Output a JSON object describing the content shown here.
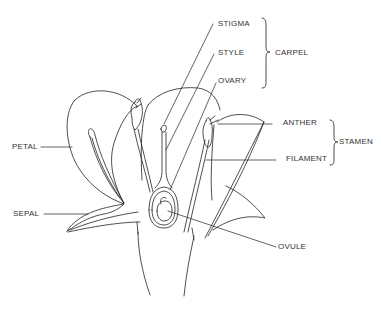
{
  "diagram": {
    "type": "labeled-illustration",
    "line_color": "#222222",
    "background": "#ffffff"
  },
  "labels": {
    "stigma": "STIGMA",
    "style": "STYLE",
    "ovary": "OVARY",
    "carpel": "CARPEL",
    "anther": "ANTHER",
    "filament": "FILAMENT",
    "stamen": "STAMEN",
    "petal": "PETAL",
    "sepal": "SEPAL",
    "ovule": "OVULE"
  },
  "groups": [
    {
      "name": "CARPEL",
      "members": [
        "STIGMA",
        "STYLE",
        "OVARY"
      ]
    },
    {
      "name": "STAMEN",
      "members": [
        "ANTHER",
        "FILAMENT"
      ]
    }
  ]
}
